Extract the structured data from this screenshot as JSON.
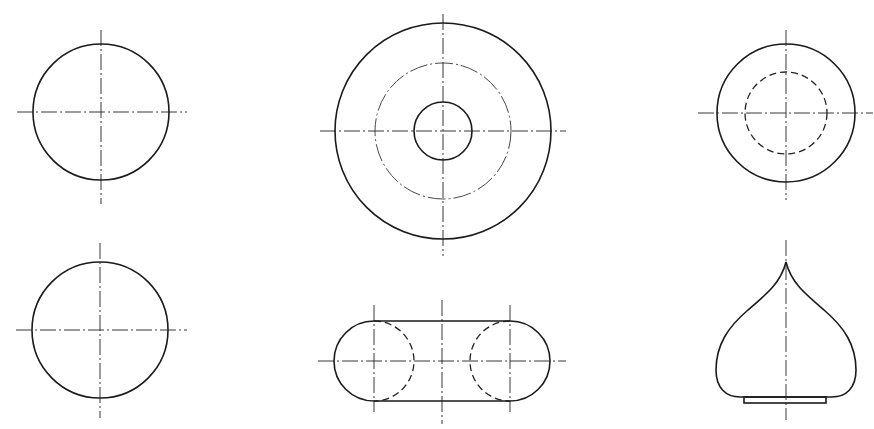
{
  "drawing": {
    "title": "",
    "background": "#ffffff",
    "line_color": "#1a1a1a",
    "views": [
      {
        "id": "circle-top-left",
        "type": "circle-with-centerlines",
        "center": [
          101,
          112
        ],
        "radius": 68
      },
      {
        "id": "concentric-top-middle",
        "type": "concentric-circles",
        "center": [
          443,
          131
        ],
        "radii": {
          "outer": 108,
          "pitch": 68,
          "inner": 29
        }
      },
      {
        "id": "circle-hidden-top-right",
        "type": "circle-with-hidden-circle",
        "center": [
          786,
          113
        ],
        "radii": {
          "outer": 69,
          "hidden": 41
        }
      },
      {
        "id": "circle-bottom-left",
        "type": "circle-with-centerlines",
        "center": [
          100,
          330
        ],
        "radius": 68
      },
      {
        "id": "stadium-bottom-middle",
        "type": "slot-with-hidden-arcs",
        "center": [
          442,
          361
        ],
        "radius": 40,
        "arc_centers_x": [
          374,
          510
        ]
      },
      {
        "id": "onion-dome-bottom-right",
        "type": "dome-profile",
        "tip": [
          786,
          262
        ],
        "base_y": 397,
        "max_width": [
          716,
          855
        ]
      }
    ]
  }
}
